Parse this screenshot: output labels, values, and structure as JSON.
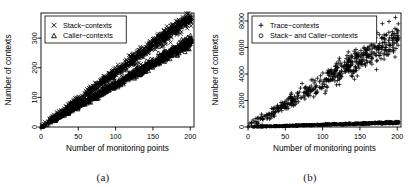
{
  "figure": {
    "panels": [
      {
        "id": "a",
        "caption": "(a)",
        "chart_data": {
          "type": "scatter",
          "title": "",
          "xlabel": "Number of monitoring points",
          "ylabel": "Number of contexts",
          "xlim": [
            0,
            205
          ],
          "ylim": [
            0,
            385
          ],
          "xticks": [
            0,
            50,
            100,
            150,
            200
          ],
          "yticks": [
            0,
            100,
            200,
            300
          ],
          "grid": false,
          "legend_position": "top-left",
          "series": [
            {
              "name": "Stack−contexts",
              "marker": "x",
              "slope": 1.85,
              "intercept": 0,
              "noise": 13,
              "n": 900,
              "seed": 17
            },
            {
              "name": "Caller−contexts",
              "marker": "triangle",
              "slope": 1.44,
              "intercept": 0,
              "noise": 10,
              "n": 900,
              "seed": 43
            }
          ]
        }
      },
      {
        "id": "b",
        "caption": "(b)",
        "chart_data": {
          "type": "scatter",
          "title": "",
          "xlabel": "Number of monitoring points",
          "ylabel": "Number of contexts",
          "xlim": [
            0,
            205
          ],
          "ylim": [
            0,
            8600
          ],
          "xticks": [
            0,
            50,
            100,
            150,
            200
          ],
          "yticks": [
            0,
            2000,
            4000,
            6000,
            8000
          ],
          "grid": false,
          "legend_position": "top-left",
          "series": [
            {
              "name": "Trace−contexts",
              "marker": "plus",
              "slope": 34.0,
              "intercept": 0,
              "noise": 620,
              "n": 520,
              "seed": 91
            },
            {
              "name": "Stack− and Caller−contexts",
              "marker": "circle",
              "slope": 1.7,
              "intercept": 0,
              "noise": 45,
              "n": 700,
              "seed": 5
            }
          ]
        }
      }
    ]
  }
}
